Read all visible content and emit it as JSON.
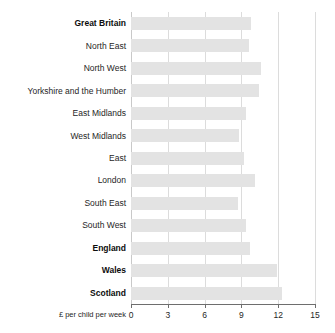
{
  "chart_data": {
    "type": "bar",
    "orientation": "horizontal",
    "title": "",
    "subtitle": "",
    "xlabel": "£ per child per week",
    "ylabel": "",
    "xlim": [
      0,
      15
    ],
    "xticks": [
      0,
      3,
      6,
      9,
      12,
      15
    ],
    "xtick_labels": [
      "0",
      "3",
      "6",
      "9",
      "12",
      "15"
    ],
    "grid": true,
    "grid_axis": "x",
    "legend": false,
    "legend_position": "none",
    "bar_color": "#e3e3e3",
    "gridline_color": "#dcdcdc",
    "axis_color": "#6e6e6e",
    "categories": [
      "Great Britain",
      "North East",
      "North West",
      "Yorkshire and the Humber",
      "East Midlands",
      "West Midlands",
      "East",
      "London",
      "South East",
      "South West",
      "England",
      "Wales",
      "Scotland"
    ],
    "values": [
      9.8,
      9.6,
      10.6,
      10.4,
      9.4,
      8.8,
      9.2,
      10.1,
      8.7,
      9.4,
      9.7,
      11.9,
      12.3
    ],
    "emphasis": [
      true,
      false,
      false,
      false,
      false,
      false,
      false,
      false,
      false,
      false,
      true,
      true,
      true
    ]
  }
}
